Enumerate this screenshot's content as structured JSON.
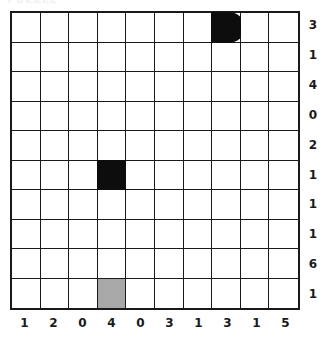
{
  "header": {
    "clipped_text": "PUZZLE"
  },
  "grid": {
    "rows": 10,
    "cols": 10,
    "border_color": "#1a1a1a",
    "cell_background": "#ffffff",
    "black_color": "#0d0d0d",
    "gray_color": "#a8a8a8"
  },
  "row_clues": [
    "3",
    "1",
    "4",
    "0",
    "2",
    "1",
    "1",
    "1",
    "6",
    "1"
  ],
  "col_clues": [
    "1",
    "2",
    "0",
    "4",
    "0",
    "3",
    "1",
    "3",
    "1",
    "5"
  ],
  "filled_cells": [
    {
      "row": 1,
      "col": 8,
      "style": "black-round-right",
      "label": "black-pill-cell"
    },
    {
      "row": 6,
      "col": 4,
      "style": "black",
      "label": "black-square-cell"
    },
    {
      "row": 10,
      "col": 4,
      "style": "gray",
      "label": "gray-square-cell"
    }
  ]
}
